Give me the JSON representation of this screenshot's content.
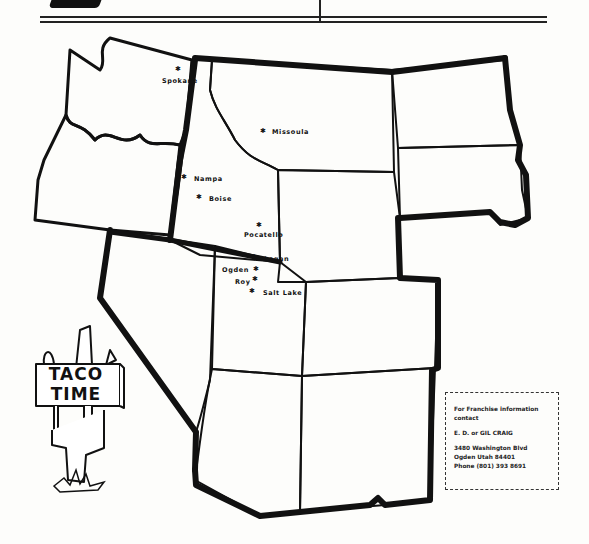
{
  "header": {
    "rules": 2
  },
  "map": {
    "title": "Taco Time franchise territory map",
    "cities": [
      {
        "name": "Spokane",
        "x": 163,
        "y": 80,
        "star_x": 177,
        "star_y": 68
      },
      {
        "name": "Missoula",
        "x": 273,
        "y": 131,
        "star_x": 262,
        "star_y": 130
      },
      {
        "name": "Nampa",
        "x": 194,
        "y": 178,
        "star_x": 182,
        "star_y": 176
      },
      {
        "name": "Boise",
        "x": 208,
        "y": 198,
        "star_x": 197,
        "star_y": 196
      },
      {
        "name": "Pocatello",
        "x": 244,
        "y": 234,
        "star_x": 257,
        "star_y": 224
      },
      {
        "name": "Logan",
        "x": 264,
        "y": 258,
        "star_x": 252,
        "star_y": 256
      },
      {
        "name": "Ogden",
        "x": 222,
        "y": 269,
        "star_x": 254,
        "star_y": 269
      },
      {
        "name": "Roy",
        "x": 234,
        "y": 281,
        "star_x": 253,
        "star_y": 279
      },
      {
        "name": "Salt Lake",
        "x": 263,
        "y": 292,
        "star_x": 250,
        "star_y": 290
      }
    ]
  },
  "logo": {
    "line1": "TACO",
    "line2": "TIME"
  },
  "info_box": {
    "line1": "For Franchise information",
    "line2": "contact",
    "name": "E. D. or GIL CRAIG",
    "address": "3480 Washington Blvd",
    "city": "Ogden  Utah 84401",
    "phone": "Phone  (801)  393 8691"
  }
}
